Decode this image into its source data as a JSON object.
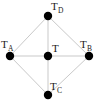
{
  "diagram": {
    "type": "graph",
    "title": "",
    "style": {
      "background": "#ffffff",
      "node_color": "#000000",
      "edge_color": "#c9c9c9",
      "label_color": "#1a1a1a",
      "node_radius": 4.2,
      "edge_width": 1
    },
    "nodes": [
      {
        "id": "TD",
        "label_main": "T",
        "label_sub": "D",
        "label_full": "T_D",
        "x": 48,
        "y": 16,
        "label_x": 51,
        "label_y": 1
      },
      {
        "id": "TA",
        "label_main": "T",
        "label_sub": "A",
        "label_full": "T_A",
        "x": 10,
        "y": 56,
        "label_x": 1,
        "label_y": 39
      },
      {
        "id": "TB",
        "label_main": "T",
        "label_sub": "B",
        "label_full": "T_B",
        "x": 89,
        "y": 56,
        "label_x": 80,
        "label_y": 39
      },
      {
        "id": "T",
        "label_main": "T",
        "label_sub": "",
        "label_full": "T",
        "x": 48,
        "y": 56,
        "label_x": 52,
        "label_y": 43
      },
      {
        "id": "TC",
        "label_main": "T",
        "label_sub": "C",
        "label_full": "T_C",
        "x": 48,
        "y": 95,
        "label_x": 50,
        "label_y": 81
      }
    ],
    "edges": [
      {
        "from": "TA",
        "to": "TD"
      },
      {
        "from": "TD",
        "to": "TB"
      },
      {
        "from": "TB",
        "to": "TC"
      },
      {
        "from": "TC",
        "to": "TA"
      },
      {
        "from": "TA",
        "to": "TB"
      },
      {
        "from": "TD",
        "to": "TC"
      }
    ]
  }
}
